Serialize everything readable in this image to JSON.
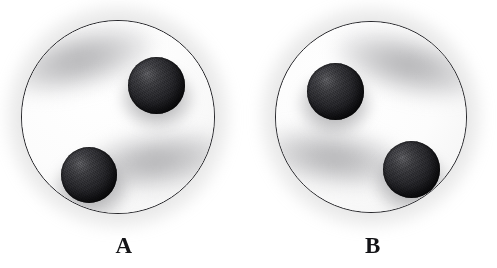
{
  "figure": {
    "caption_style": "bold-serif",
    "background_color": "#ffffff",
    "panel_count": 2
  },
  "panels": [
    {
      "id": "A",
      "label": "A",
      "dish": {
        "center_x": 118,
        "center_y": 117,
        "radius": 97,
        "fill_color": "#ffffff",
        "outline_color": "#26262a",
        "outline_width": 1.3
      },
      "spheres": [
        {
          "name": "upper-right-sphere",
          "center_x": 155,
          "center_y": 84,
          "diameter": 57,
          "color": "#24242a",
          "highlight_position": "upper-left"
        },
        {
          "name": "lower-left-sphere",
          "center_x": 88,
          "center_y": 174,
          "diameter": 56,
          "color": "#24242a",
          "highlight_position": "upper-left"
        }
      ],
      "shadows": [
        {
          "name": "upper-sphere-shadow",
          "direction": "upper-left"
        },
        {
          "name": "lower-sphere-shadow",
          "direction": "right"
        }
      ]
    },
    {
      "id": "B",
      "label": "B",
      "dish": {
        "center_x": 122,
        "center_y": 117,
        "radius": 96,
        "fill_color": "#ffffff",
        "outline_color": "#26262a",
        "outline_width": 1.3
      },
      "spheres": [
        {
          "name": "upper-left-sphere",
          "center_x": 85,
          "center_y": 90,
          "diameter": 57,
          "color": "#24242a",
          "highlight_position": "upper-left"
        },
        {
          "name": "lower-right-sphere",
          "center_x": 161,
          "center_y": 168,
          "diameter": 57,
          "color": "#24242a",
          "highlight_position": "upper-left"
        }
      ],
      "shadows": [
        {
          "name": "upper-sphere-shadow",
          "direction": "upper-right"
        },
        {
          "name": "lower-sphere-shadow",
          "direction": "left"
        }
      ]
    }
  ]
}
